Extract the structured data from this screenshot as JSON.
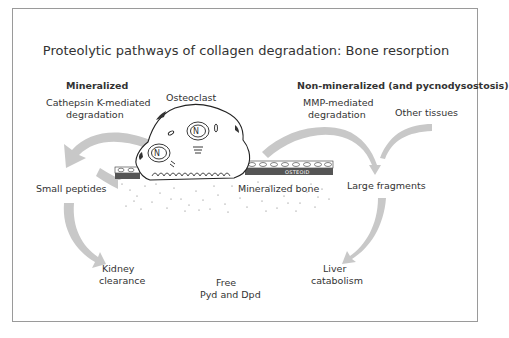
{
  "figure": {
    "title": "Proteolytic pathways of collagen degradation: Bone resorption",
    "sections": {
      "left_heading": "Mineralized",
      "right_heading": "Non-mineralized (and pycnodysostosis)"
    },
    "labels": {
      "cathepsin_line1": "Cathepsin K-mediated",
      "cathepsin_line2": "degradation",
      "osteoclast": "Osteoclast",
      "mmp_line1": "MMP-mediated",
      "mmp_line2": "degradation",
      "other_tissues": "Other tissues",
      "small_peptides": "Small peptides",
      "large_fragments": "Large fragments",
      "mineralized_bone": "Mineralized bone",
      "osteoid": "OSTEOID",
      "nucleus": "N",
      "kidney_line1": "Kidney",
      "kidney_line2": "clearance",
      "free_line1": "Free",
      "free_line2": "Pyd and Dpd",
      "liver_line1": "Liver",
      "liver_line2": "catabolism"
    },
    "colors": {
      "arrow": "#c8c8c8",
      "border": "#9a9a9a",
      "text": "#333333"
    }
  }
}
